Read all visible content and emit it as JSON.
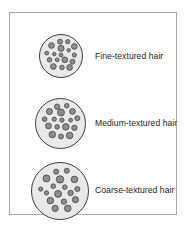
{
  "figure": {
    "background_color": "#ffffff",
    "frame_color": "#a9a9a9"
  },
  "style": {
    "circle_fill": "#e9e9e9",
    "circle_stroke": "#404040",
    "dot_fill": "#8e8e8e",
    "dot_stroke": "#4a4a4a",
    "text_color": "#1d1d1d"
  },
  "rows": [
    {
      "key": "fine",
      "label": "Fine-textured hair",
      "circle_diameter_px": 44,
      "dot_count": 17,
      "description": "Smallest bundle with many small-diameter hair shafts"
    },
    {
      "key": "medium",
      "label": "Medium-textured hair",
      "circle_diameter_px": 51,
      "dot_count": 17,
      "description": "Medium bundle with medium-diameter hair shafts"
    },
    {
      "key": "coarse",
      "label": "Coarse-textured hair",
      "circle_diameter_px": 58,
      "dot_count": 17,
      "description": "Largest bundle with large-diameter hair shafts"
    }
  ],
  "chart_data": {
    "type": "scatter",
    "xlabel": "",
    "ylabel": "",
    "categories": [
      "Fine-textured hair",
      "Medium-textured hair",
      "Coarse-textured hair"
    ],
    "series": [
      {
        "name": "bundle diameter (px)",
        "values": [
          44,
          51,
          58
        ]
      },
      {
        "name": "hair shafts shown",
        "values": [
          17,
          17,
          17
        ]
      }
    ],
    "dots": {
      "fine": [
        {
          "cx": 21,
          "cy": 7,
          "r": 2.6
        },
        {
          "cx": 29,
          "cy": 7,
          "r": 2.2
        },
        {
          "cx": 12,
          "cy": 11,
          "r": 3.0
        },
        {
          "cx": 36,
          "cy": 12,
          "r": 3.0
        },
        {
          "cx": 22,
          "cy": 14,
          "r": 3.2
        },
        {
          "cx": 30,
          "cy": 16,
          "r": 1.8
        },
        {
          "cx": 7,
          "cy": 19,
          "r": 2.0
        },
        {
          "cx": 15,
          "cy": 20,
          "r": 1.8
        },
        {
          "cx": 22,
          "cy": 21,
          "r": 2.0
        },
        {
          "cx": 36,
          "cy": 21,
          "r": 2.2
        },
        {
          "cx": 10,
          "cy": 26,
          "r": 2.4
        },
        {
          "cx": 18,
          "cy": 26,
          "r": 2.0
        },
        {
          "cx": 26,
          "cy": 26,
          "r": 3.0
        },
        {
          "cx": 34,
          "cy": 28,
          "r": 2.6
        },
        {
          "cx": 14,
          "cy": 33,
          "r": 3.0
        },
        {
          "cx": 23,
          "cy": 34,
          "r": 2.4
        },
        {
          "cx": 31,
          "cy": 34,
          "r": 3.0
        }
      ],
      "medium": [
        {
          "cx": 22,
          "cy": 8,
          "r": 2.8
        },
        {
          "cx": 32,
          "cy": 7,
          "r": 2.4
        },
        {
          "cx": 14,
          "cy": 13,
          "r": 3.2
        },
        {
          "cx": 26,
          "cy": 14,
          "r": 3.6
        },
        {
          "cx": 38,
          "cy": 13,
          "r": 3.0
        },
        {
          "cx": 9,
          "cy": 21,
          "r": 2.4
        },
        {
          "cx": 19,
          "cy": 21,
          "r": 2.2
        },
        {
          "cx": 27,
          "cy": 22,
          "r": 2.2
        },
        {
          "cx": 36,
          "cy": 22,
          "r": 2.0
        },
        {
          "cx": 43,
          "cy": 20,
          "r": 2.6
        },
        {
          "cx": 13,
          "cy": 28,
          "r": 3.0
        },
        {
          "cx": 22,
          "cy": 29,
          "r": 2.4
        },
        {
          "cx": 31,
          "cy": 29,
          "r": 3.4
        },
        {
          "cx": 40,
          "cy": 30,
          "r": 2.8
        },
        {
          "cx": 17,
          "cy": 37,
          "r": 3.4
        },
        {
          "cx": 26,
          "cy": 39,
          "r": 2.6
        },
        {
          "cx": 35,
          "cy": 38,
          "r": 3.4
        }
      ],
      "coarse": [
        {
          "cx": 25,
          "cy": 9,
          "r": 2.6
        },
        {
          "cx": 36,
          "cy": 8,
          "r": 2.6
        },
        {
          "cx": 15,
          "cy": 16,
          "r": 3.6
        },
        {
          "cx": 29,
          "cy": 17,
          "r": 3.8
        },
        {
          "cx": 44,
          "cy": 17,
          "r": 3.4
        },
        {
          "cx": 22,
          "cy": 24,
          "r": 2.4
        },
        {
          "cx": 34,
          "cy": 25,
          "r": 2.4
        },
        {
          "cx": 9,
          "cy": 27,
          "r": 2.2
        },
        {
          "cx": 47,
          "cy": 27,
          "r": 2.6
        },
        {
          "cx": 15,
          "cy": 31,
          "r": 2.2
        },
        {
          "cx": 27,
          "cy": 32,
          "r": 3.6
        },
        {
          "cx": 40,
          "cy": 31,
          "r": 2.8
        },
        {
          "cx": 19,
          "cy": 39,
          "r": 3.4
        },
        {
          "cx": 33,
          "cy": 40,
          "r": 2.8
        },
        {
          "cx": 45,
          "cy": 38,
          "r": 3.2
        },
        {
          "cx": 24,
          "cy": 47,
          "r": 3.2
        },
        {
          "cx": 37,
          "cy": 47,
          "r": 3.4
        }
      ]
    }
  }
}
